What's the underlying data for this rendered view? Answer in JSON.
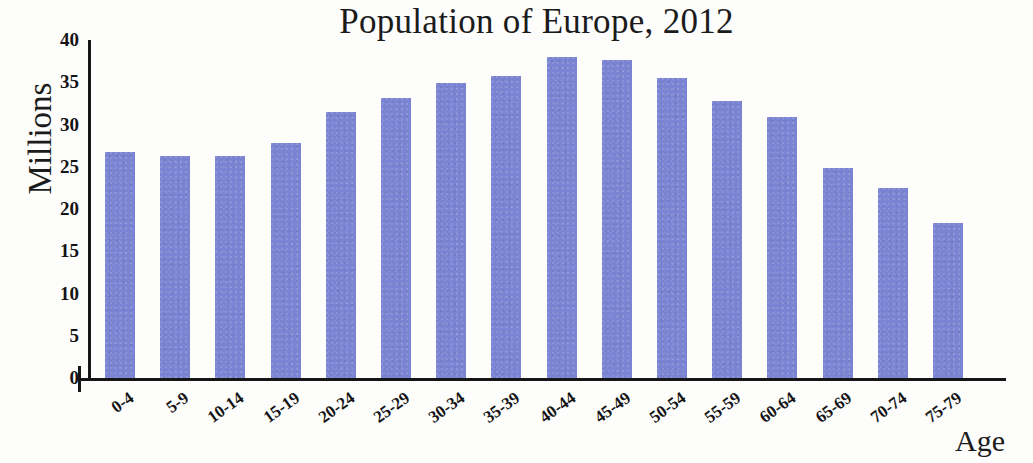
{
  "chart_data": {
    "type": "bar",
    "title": "Population of Europe, 2012",
    "xlabel": "Age",
    "ylabel": "Millions",
    "categories": [
      "0-4",
      "5-9",
      "10-14",
      "15-19",
      "20-24",
      "25-29",
      "30-34",
      "35-39",
      "40-44",
      "45-49",
      "50-54",
      "55-59",
      "60-64",
      "65-69",
      "70-74",
      "75-79"
    ],
    "values": [
      26.8,
      26.3,
      26.3,
      27.8,
      31.5,
      33.1,
      34.9,
      35.7,
      38.0,
      37.6,
      35.5,
      32.8,
      30.9,
      24.8,
      22.5,
      18.3
    ],
    "ylim": [
      0,
      40
    ],
    "yticks": [
      0,
      5,
      10,
      15,
      20,
      25,
      30,
      35,
      40
    ],
    "ytick_labels": [
      "0",
      "5",
      "10",
      "15",
      "20",
      "25",
      "30",
      "35",
      "40"
    ],
    "grid": false,
    "legend": null,
    "bar_color": "#7b84d2",
    "axis_color": "#161616",
    "background_color": "#fdfdfc"
  }
}
